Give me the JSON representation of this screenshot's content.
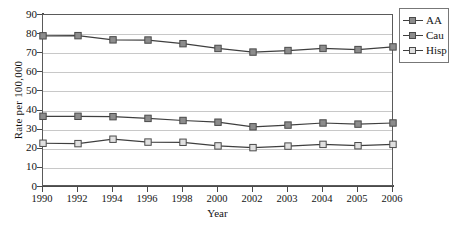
{
  "chart_data": {
    "type": "line",
    "title": "",
    "xlabel": "Year",
    "ylabel": "Rate per 100,000",
    "categories": [
      "1990",
      "1992",
      "1994",
      "1996",
      "1998",
      "2000",
      "2002",
      "2003",
      "2004",
      "2005",
      "2006"
    ],
    "ylim": [
      0,
      90
    ],
    "ytick_step": 10,
    "yticks": [
      "90",
      "80",
      "70",
      "60",
      "50",
      "40",
      "30",
      "20",
      "10",
      "0"
    ],
    "grid": "horizontal",
    "legend_position": "right",
    "series": [
      {
        "name": "AA",
        "marker": "square",
        "marker_fill": "#8c8c8c",
        "line_color": "#3f3f3f",
        "values": [
          37,
          37,
          36.8,
          35.9,
          34.8,
          33.9,
          31.5,
          32.4,
          33.5,
          32.9,
          33.5
        ]
      },
      {
        "name": "Cau",
        "marker": "square",
        "marker_fill": "#8c8c8c",
        "line_color": "#3f3f3f",
        "values": [
          79.1,
          79.2,
          77,
          76.9,
          75,
          72.5,
          70.6,
          71.4,
          72.5,
          71.9,
          73.3
        ]
      },
      {
        "name": "Hisp",
        "marker": "square",
        "marker_fill": "#e0e0e0",
        "line_color": "#3f3f3f",
        "values": [
          22.9,
          22.7,
          25,
          23.5,
          23.4,
          21.5,
          20.6,
          21.4,
          22.3,
          21.6,
          22.3
        ]
      }
    ]
  },
  "legend": {
    "items": [
      {
        "label": "AA"
      },
      {
        "label": "Cau"
      },
      {
        "label": "Hisp"
      }
    ]
  },
  "colors": {
    "axis": "#4a4a4a",
    "grid": "#c8c8c8",
    "line": "#3f3f3f",
    "marker_dark": "#8c8c8c",
    "marker_light": "#e0e0e0",
    "text": "#141414"
  }
}
